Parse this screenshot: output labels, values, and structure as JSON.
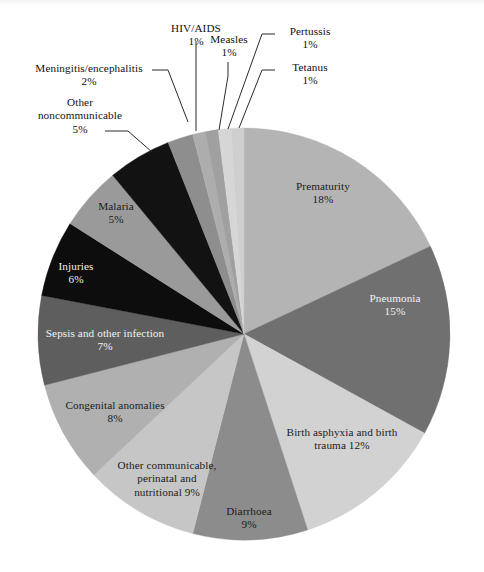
{
  "chart_data": {
    "type": "pie",
    "title": "",
    "subtitle": "",
    "xlabel": "",
    "ylabel": "",
    "legend_position": "none",
    "grid": false,
    "units": "%",
    "start_angle_deg": 0,
    "direction": "clockwise",
    "categories": [
      "Prematurity",
      "Pneumonia",
      "Birth asphyxia and birth trauma",
      "Diarrhoea",
      "Other communicable, perinatal and nutritional",
      "Congenital anomalies",
      "Sepsis and other infection",
      "Injuries",
      "Malaria",
      "Other noncommunicable",
      "Meningitis/encephalitis",
      "HIV/AIDS",
      "Measles",
      "Pertussis",
      "Tetanus"
    ],
    "values": [
      18,
      15,
      12,
      9,
      9,
      8,
      7,
      6,
      5,
      5,
      2,
      1,
      1,
      1,
      1
    ],
    "colors": [
      "#b4b4b4",
      "#707070",
      "#d2d2d2",
      "#8c8c8c",
      "#c6c6c6",
      "#b0b0b0",
      "#5e5e5e",
      "#0d0d0d",
      "#9a9a9a",
      "#121212",
      "#8e8e8e",
      "#adadad",
      "#a0a0a0",
      "#d6d6d6",
      "#cfcfcf"
    ],
    "slices": [
      {
        "label": "Prematurity",
        "value": 18,
        "display": "Prematurity\n18%",
        "color": "#b4b4b4",
        "label_placement": "inside"
      },
      {
        "label": "Pneumonia",
        "value": 15,
        "display": "Pneumonia\n15%",
        "color": "#707070",
        "label_placement": "inside"
      },
      {
        "label": "Birth asphyxia and birth trauma",
        "value": 12,
        "display": "Birth asphyxia and birth\ntrauma 12%",
        "color": "#d2d2d2",
        "label_placement": "inside"
      },
      {
        "label": "Diarrhoea",
        "value": 9,
        "display": "Diarrhoea\n9%",
        "color": "#8c8c8c",
        "label_placement": "inside"
      },
      {
        "label": "Other communicable, perinatal and nutritional",
        "value": 9,
        "display": "Other communicable,\nperinatal and\nnutritional 9%",
        "color": "#c6c6c6",
        "label_placement": "inside"
      },
      {
        "label": "Congenital anomalies",
        "value": 8,
        "display": "Congenital anomalies\n8%",
        "color": "#b0b0b0",
        "label_placement": "inside"
      },
      {
        "label": "Sepsis and other infection",
        "value": 7,
        "display": "Sepsis and other infection\n7%",
        "color": "#5e5e5e",
        "label_placement": "inside"
      },
      {
        "label": "Injuries",
        "value": 6,
        "display": "Injuries\n6%",
        "color": "#0d0d0d",
        "label_placement": "inside"
      },
      {
        "label": "Malaria",
        "value": 5,
        "display": "Malaria\n5%",
        "color": "#9a9a9a",
        "label_placement": "inside"
      },
      {
        "label": "Other noncommunicable",
        "value": 5,
        "display": "Other\nnoncommunicable\n5%",
        "color": "#121212",
        "label_placement": "outside-left"
      },
      {
        "label": "Meningitis/encephalitis",
        "value": 2,
        "display": "Meningitis/encephalitis\n2%",
        "color": "#8e8e8e",
        "label_placement": "outside-left"
      },
      {
        "label": "HIV/AIDS",
        "value": 1,
        "display": "HIV/AIDS\n1%",
        "color": "#adadad",
        "label_placement": "outside-top"
      },
      {
        "label": "Measles",
        "value": 1,
        "display": "Measles\n1%",
        "color": "#a0a0a0",
        "label_placement": "outside-top"
      },
      {
        "label": "Pertussis",
        "value": 1,
        "display": "Pertussis\n1%",
        "color": "#d6d6d6",
        "label_placement": "outside-right"
      },
      {
        "label": "Tetanus",
        "value": 1,
        "display": "Tetanus\n1%",
        "color": "#cfcfcf",
        "label_placement": "outside-right"
      }
    ]
  },
  "labels": {
    "prematurity": "Prematurity\n18%",
    "pneumonia": "Pneumonia\n15%",
    "birth_asphyxia": "Birth asphyxia and birth\ntrauma 12%",
    "diarrhoea": "Diarrhoea\n9%",
    "other_communicable": "Other communicable,\nperinatal and\nnutritional 9%",
    "congenital_anomalies": "Congenital anomalies\n8%",
    "sepsis": "Sepsis and other infection\n7%",
    "injuries": "Injuries\n6%",
    "malaria": "Malaria\n5%",
    "other_noncommunicable": "Other\nnoncommunicable\n5%",
    "meningitis": "Meningitis/encephalitis\n2%",
    "hiv_aids": "HIV/AIDS\n1%",
    "measles": "Measles\n1%",
    "pertussis": "Pertussis\n1%",
    "tetanus": "Tetanus\n1%"
  }
}
